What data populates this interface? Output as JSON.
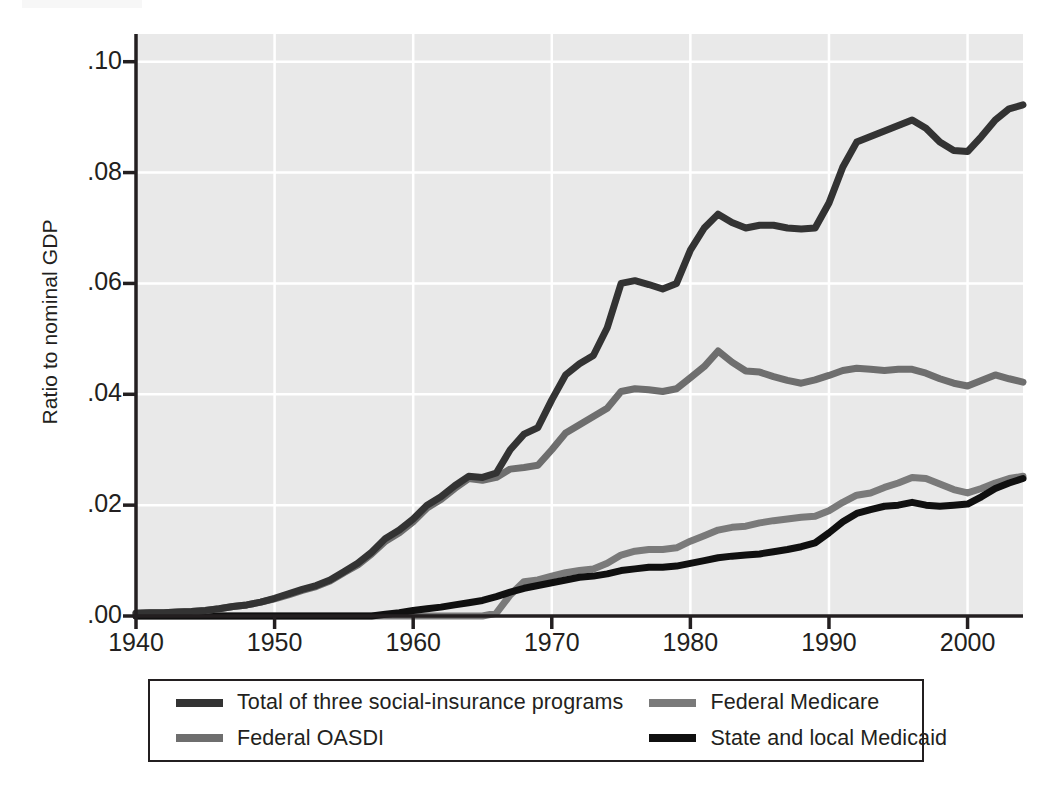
{
  "figure": {
    "plot_area": {
      "left": 136,
      "top": 34,
      "right": 1023,
      "bottom": 616
    },
    "background": "#e9e9e9",
    "gridline_color": "#ffffff",
    "axis_color": "#231f20"
  },
  "axes": {
    "ylabel": "Ratio to nominal GDP",
    "yticks": [
      ".00",
      ".02",
      ".04",
      ".06",
      ".08",
      ".10"
    ],
    "ytick_values": [
      0.0,
      0.02,
      0.04,
      0.06,
      0.08,
      0.1
    ],
    "xticks": [
      "1940",
      "1950",
      "1960",
      "1970",
      "1980",
      "1990",
      "2000"
    ],
    "xtick_values": [
      1940,
      1950,
      1960,
      1970,
      1980,
      1990,
      2000
    ]
  },
  "legend": {
    "items": [
      {
        "label": "Total of three social-insurance programs",
        "color": "#333333"
      },
      {
        "label": "Federal Medicare",
        "color": "#7a7a7a"
      },
      {
        "label": "Federal OASDI",
        "color": "#6e6e6e"
      },
      {
        "label": "State and local Medicaid",
        "color": "#101010"
      }
    ]
  },
  "chart_data": {
    "type": "line",
    "title": "",
    "xlabel": "",
    "ylabel": "Ratio to nominal GDP",
    "xlim": [
      1940,
      2004
    ],
    "ylim": [
      0.0,
      0.105
    ],
    "grid": true,
    "legend_position": "below",
    "x": [
      1940,
      1941,
      1942,
      1943,
      1944,
      1945,
      1946,
      1947,
      1948,
      1949,
      1950,
      1951,
      1952,
      1953,
      1954,
      1955,
      1956,
      1957,
      1958,
      1959,
      1960,
      1961,
      1962,
      1963,
      1964,
      1965,
      1966,
      1967,
      1968,
      1969,
      1970,
      1971,
      1972,
      1973,
      1974,
      1975,
      1976,
      1977,
      1978,
      1979,
      1980,
      1981,
      1982,
      1983,
      1984,
      1985,
      1986,
      1987,
      1988,
      1989,
      1990,
      1991,
      1992,
      1993,
      1994,
      1995,
      1996,
      1997,
      1998,
      1999,
      2000,
      2001,
      2002,
      2003,
      2004
    ],
    "series": [
      {
        "name": "Total of three social-insurance programs",
        "color": "#333333",
        "width": 7,
        "values": [
          0.0005,
          0.0006,
          0.0006,
          0.0007,
          0.0008,
          0.001,
          0.0013,
          0.0017,
          0.002,
          0.0025,
          0.0032,
          0.004,
          0.0048,
          0.0055,
          0.0065,
          0.008,
          0.0095,
          0.0115,
          0.014,
          0.0155,
          0.0175,
          0.02,
          0.0215,
          0.0235,
          0.0252,
          0.025,
          0.0258,
          0.03,
          0.0328,
          0.034,
          0.039,
          0.0435,
          0.0455,
          0.047,
          0.052,
          0.06,
          0.0605,
          0.0598,
          0.059,
          0.06,
          0.066,
          0.07,
          0.0725,
          0.071,
          0.07,
          0.0705,
          0.0705,
          0.07,
          0.0698,
          0.07,
          0.0745,
          0.081,
          0.0855,
          0.0865,
          0.0875,
          0.0885,
          0.0895,
          0.088,
          0.0855,
          0.084,
          0.0838,
          0.0865,
          0.0895,
          0.0915,
          0.0922
        ]
      },
      {
        "name": "Federal OASDI",
        "color": "#6e6e6e",
        "width": 7,
        "values": [
          0.0005,
          0.0006,
          0.0006,
          0.0007,
          0.0008,
          0.001,
          0.0013,
          0.0017,
          0.002,
          0.0025,
          0.0031,
          0.0038,
          0.0046,
          0.0053,
          0.0063,
          0.0078,
          0.0092,
          0.0112,
          0.0135,
          0.015,
          0.017,
          0.0195,
          0.021,
          0.023,
          0.0248,
          0.0245,
          0.025,
          0.0265,
          0.0268,
          0.0272,
          0.03,
          0.033,
          0.0345,
          0.036,
          0.0375,
          0.0405,
          0.041,
          0.0408,
          0.0405,
          0.041,
          0.043,
          0.045,
          0.0478,
          0.0458,
          0.0442,
          0.044,
          0.0432,
          0.0425,
          0.042,
          0.0426,
          0.0434,
          0.0443,
          0.0447,
          0.0445,
          0.0443,
          0.0445,
          0.0445,
          0.0438,
          0.0428,
          0.042,
          0.0415,
          0.0425,
          0.0435,
          0.0428,
          0.0422
        ]
      },
      {
        "name": "Federal Medicare",
        "color": "#7a7a7a",
        "width": 7,
        "values": [
          0,
          0,
          0,
          0,
          0,
          0,
          0,
          0,
          0,
          0,
          0,
          0,
          0,
          0,
          0,
          0,
          0,
          0,
          0,
          0,
          0,
          0,
          0,
          0,
          0,
          0,
          0.0005,
          0.0038,
          0.0062,
          0.0065,
          0.0072,
          0.0078,
          0.0082,
          0.0085,
          0.0095,
          0.011,
          0.0117,
          0.012,
          0.012,
          0.0123,
          0.0135,
          0.0145,
          0.0155,
          0.016,
          0.0162,
          0.0168,
          0.0172,
          0.0175,
          0.0178,
          0.018,
          0.019,
          0.0205,
          0.0218,
          0.0222,
          0.0232,
          0.024,
          0.025,
          0.0248,
          0.0238,
          0.0228,
          0.0222,
          0.023,
          0.024,
          0.0248,
          0.0252
        ]
      },
      {
        "name": "State and local Medicaid",
        "color": "#101010",
        "width": 7,
        "values": [
          0,
          0,
          0,
          0,
          0,
          0,
          0,
          0,
          0,
          0,
          0,
          0,
          0,
          0,
          0,
          0,
          0,
          0,
          0.0003,
          0.0006,
          0.001,
          0.0013,
          0.0016,
          0.002,
          0.0024,
          0.0028,
          0.0035,
          0.0043,
          0.005,
          0.0055,
          0.006,
          0.0065,
          0.007,
          0.0072,
          0.0076,
          0.0082,
          0.0085,
          0.0088,
          0.0088,
          0.009,
          0.0095,
          0.01,
          0.0105,
          0.0108,
          0.011,
          0.0112,
          0.0116,
          0.012,
          0.0125,
          0.0132,
          0.015,
          0.017,
          0.0185,
          0.0192,
          0.0198,
          0.02,
          0.0205,
          0.02,
          0.0198,
          0.02,
          0.0202,
          0.0215,
          0.023,
          0.024,
          0.0248
        ]
      }
    ]
  }
}
